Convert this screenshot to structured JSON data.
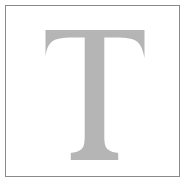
{
  "artwork": {
    "kind": "letterform-specimen",
    "letter": "T",
    "letter_style": "serif-capital",
    "caption": "",
    "colors": {
      "background": "#ffffff",
      "frame_border": "#8a8a8a",
      "frame_fill": "#ffffff",
      "glyph_fill": "#b5b5b5"
    },
    "frame": {
      "x": 5,
      "y": 5,
      "width": 175,
      "height": 172,
      "border_width": 1
    },
    "glyph_metrics": {
      "bar_left": 45,
      "bar_right": 145,
      "bar_top": 30,
      "bar_solid_bottom": 39,
      "serif_drop_bottom": 58,
      "stem_left": 85,
      "stem_right": 104,
      "stem_center_x": 94.5,
      "stem_bottom": 150,
      "foot_left": 70,
      "foot_right": 118,
      "foot_bottom": 160
    }
  }
}
